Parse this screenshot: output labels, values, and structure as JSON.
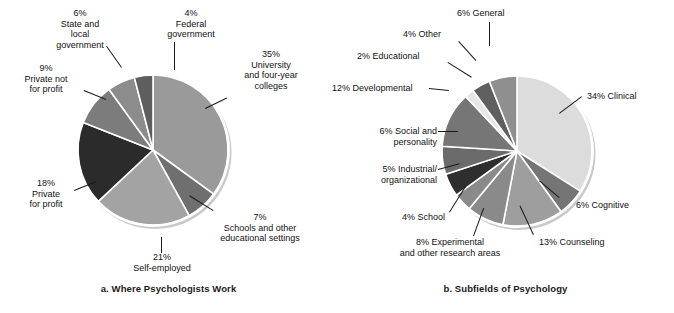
{
  "figure": {
    "background": "#ffffff",
    "label_color": "#111111"
  },
  "charts": [
    {
      "id": "a",
      "caption": "a. Where Psychologists Work",
      "center": [
        152,
        149
      ],
      "radius": 78
    },
    {
      "id": "b",
      "caption": "b. Subfields of Psychology",
      "center": [
        517,
        150
      ],
      "radius": 78
    }
  ],
  "labels_a": {
    "state_local": "6%\nState and\nlocal\ngovernment",
    "federal": "4%\nFederal\ngovernment",
    "private_not": "9%\nPrivate not\nfor profit",
    "private_for": "18%\nPrivate\nfor profit",
    "university": "35%\nUniversity\nand four-year\ncolleges",
    "schools": "7%\nSchools and other\neducational settings",
    "self_employed": "21%\nSelf-employed"
  },
  "labels_b": {
    "general": "6% General",
    "other": "4% Other",
    "educational": "2% Educational",
    "developmental": "12% Developmental",
    "social": "6% Social and\npersonality",
    "industrial": "5% Industrial/\norganizational",
    "school": "4% School",
    "experimental": "8% Experimental\nand other research areas",
    "counseling": "13% Counseling",
    "cognitive": "6% Cognitive",
    "clinical": "34% Clinical"
  },
  "chart_data": [
    {
      "type": "pie",
      "title": "a. Where Psychologists Work",
      "xlabel": "",
      "ylabel": "",
      "start_angle_deg": 90,
      "direction": "clockwise",
      "legend": "labels-outside-with-leader-lines",
      "grid": false,
      "categories": [
        "University and four-year colleges",
        "Schools and other educational settings",
        "Self-employed",
        "Private for profit",
        "Private not for profit",
        "State and local government",
        "Federal government"
      ],
      "values": [
        35,
        7,
        21,
        18,
        9,
        6,
        4
      ],
      "value_labels": [
        "35%",
        "7%",
        "21%",
        "18%",
        "9%",
        "6%",
        "4%"
      ],
      "colors": [
        "#9a9a9a",
        "#6f6f6f",
        "#a3a3a3",
        "#2b2b2b",
        "#7c7c7c",
        "#8c8c8c",
        "#5e5e5e"
      ]
    },
    {
      "type": "pie",
      "title": "b. Subfields of Psychology",
      "xlabel": "",
      "ylabel": "",
      "start_angle_deg": 90,
      "direction": "clockwise",
      "legend": "labels-outside-with-leader-lines",
      "grid": false,
      "categories": [
        "Clinical",
        "Cognitive",
        "Counseling",
        "Experimental and other research areas",
        "School",
        "Industrial/organizational",
        "Social and personality",
        "Developmental",
        "Educational",
        "Other",
        "General"
      ],
      "values": [
        34,
        6,
        13,
        8,
        4,
        5,
        6,
        12,
        2,
        4,
        6
      ],
      "value_labels": [
        "34%",
        "6%",
        "13%",
        "8%",
        "4%",
        "5%",
        "6%",
        "12%",
        "2%",
        "4%",
        "6%"
      ],
      "colors": [
        "#dcdcdc",
        "#757575",
        "#9e9e9e",
        "#8a8a8a",
        "#8a8a8a",
        "#2e2e2e",
        "#6b6b6b",
        "#767676",
        "#e6e6e6",
        "#5f5f5f",
        "#8f8f8f"
      ]
    }
  ]
}
